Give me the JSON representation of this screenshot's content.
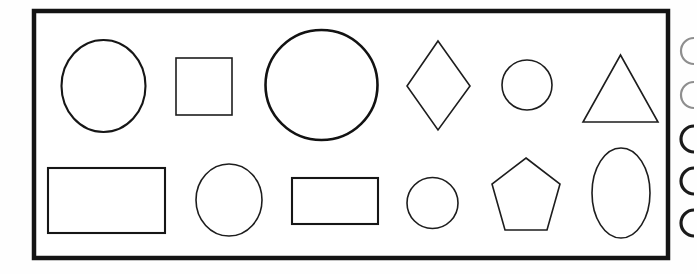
{
  "figure": {
    "name": "geometric-shapes-figure",
    "background_color": "#fefefe",
    "frame": {
      "name": "figure-border",
      "x": 34,
      "y": 11,
      "width": 634,
      "height": 247,
      "stroke_color": "#141414",
      "stroke_width": 4.5,
      "fill_color": "#ffffff"
    },
    "shape_stroke_color": "#1d1d1d",
    "rows": [
      {
        "name": "shape-row-1",
        "shapes": [
          {
            "name": "circle-1",
            "type": "circle",
            "cx": 103.5,
            "cy": 86,
            "rx": 42,
            "ry": 46,
            "weight": "medium"
          },
          {
            "name": "square-1",
            "type": "rect",
            "x": 176,
            "y": 58,
            "width": 56,
            "height": 57,
            "weight": "normal"
          },
          {
            "name": "circle-2-large",
            "type": "circle",
            "cx": 321.5,
            "cy": 85,
            "rx": 56,
            "ry": 55,
            "weight": "thick"
          },
          {
            "name": "diamond-1",
            "type": "polygon",
            "points": "438,41 470,86 438,130 407,86",
            "weight": "normal"
          },
          {
            "name": "circle-3-small",
            "type": "circle",
            "cx": 527,
            "cy": 85,
            "rx": 25,
            "ry": 25,
            "weight": "normal"
          },
          {
            "name": "triangle-1",
            "type": "polygon",
            "points": "620.5,55 658,122 583,122",
            "weight": "normal"
          }
        ]
      },
      {
        "name": "shape-row-2",
        "shapes": [
          {
            "name": "rectangle-1",
            "type": "rect",
            "x": 48,
            "y": 168,
            "width": 117,
            "height": 65,
            "weight": "medium"
          },
          {
            "name": "circle-4",
            "type": "circle",
            "cx": 229,
            "cy": 200,
            "rx": 33,
            "ry": 36,
            "weight": "normal"
          },
          {
            "name": "rectangle-2",
            "type": "rect",
            "x": 292,
            "y": 178,
            "width": 86,
            "height": 46,
            "weight": "medium"
          },
          {
            "name": "circle-5",
            "type": "circle",
            "cx": 432.5,
            "cy": 203,
            "rx": 25.5,
            "ry": 25.5,
            "weight": "normal"
          },
          {
            "name": "pentagon-1",
            "type": "polygon",
            "points": "526,158 560,184 547,230 505,230 492,184",
            "weight": "normal"
          },
          {
            "name": "ellipse-1",
            "type": "circle",
            "cx": 621,
            "cy": 193,
            "rx": 29,
            "ry": 45,
            "weight": "normal"
          }
        ]
      }
    ],
    "edge_marks": {
      "name": "cropped-edge-marks",
      "description": "partially visible curved marks cropped by the right image edge",
      "items": [
        {
          "name": "edge-mark-1",
          "x": 688,
          "y": 38,
          "height": 26,
          "faint": true
        },
        {
          "name": "edge-mark-2",
          "x": 688,
          "y": 82,
          "height": 26,
          "faint": true
        },
        {
          "name": "edge-mark-3",
          "x": 688,
          "y": 126,
          "height": 26,
          "faint": false
        },
        {
          "name": "edge-mark-4",
          "x": 688,
          "y": 168,
          "height": 26,
          "faint": false
        },
        {
          "name": "edge-mark-5",
          "x": 688,
          "y": 210,
          "height": 26,
          "faint": false
        }
      ]
    }
  }
}
